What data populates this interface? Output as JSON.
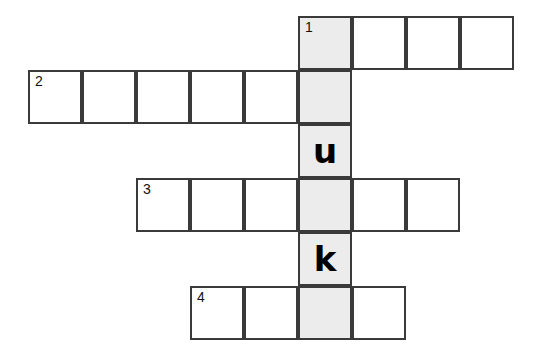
{
  "puzzle": {
    "type": "crossword-grid",
    "cell_size": 54,
    "grid_origin": {
      "x": 28,
      "y": 16
    },
    "colors": {
      "cell_fill": "#ffffff",
      "shaded_fill": "#ececec",
      "border": "#3a3a3a",
      "text": "#000000",
      "page_background": "#ffffff"
    },
    "shaded_column_index": 5,
    "rows": [
      {
        "row_index": 0,
        "start_col": 5,
        "length": 4,
        "cells": [
          {
            "col": 5,
            "clue_number": "1",
            "letter": "",
            "shaded": true
          },
          {
            "col": 6,
            "clue_number": "",
            "letter": "",
            "shaded": false
          },
          {
            "col": 7,
            "clue_number": "",
            "letter": "",
            "shaded": false
          },
          {
            "col": 8,
            "clue_number": "",
            "letter": "",
            "shaded": false
          }
        ]
      },
      {
        "row_index": 1,
        "start_col": 0,
        "length": 6,
        "cells": [
          {
            "col": 0,
            "clue_number": "2",
            "letter": "",
            "shaded": false
          },
          {
            "col": 1,
            "clue_number": "",
            "letter": "",
            "shaded": false
          },
          {
            "col": 2,
            "clue_number": "",
            "letter": "",
            "shaded": false
          },
          {
            "col": 3,
            "clue_number": "",
            "letter": "",
            "shaded": false
          },
          {
            "col": 4,
            "clue_number": "",
            "letter": "",
            "shaded": false
          },
          {
            "col": 5,
            "clue_number": "",
            "letter": "",
            "shaded": true
          }
        ]
      },
      {
        "row_index": 2,
        "start_col": 5,
        "length": 1,
        "cells": [
          {
            "col": 5,
            "clue_number": "",
            "letter": "u",
            "shaded": true
          }
        ]
      },
      {
        "row_index": 3,
        "start_col": 2,
        "length": 6,
        "cells": [
          {
            "col": 2,
            "clue_number": "3",
            "letter": "",
            "shaded": false
          },
          {
            "col": 3,
            "clue_number": "",
            "letter": "",
            "shaded": false
          },
          {
            "col": 4,
            "clue_number": "",
            "letter": "",
            "shaded": false
          },
          {
            "col": 5,
            "clue_number": "",
            "letter": "",
            "shaded": true
          },
          {
            "col": 6,
            "clue_number": "",
            "letter": "",
            "shaded": false
          },
          {
            "col": 7,
            "clue_number": "",
            "letter": "",
            "shaded": false
          }
        ]
      },
      {
        "row_index": 4,
        "start_col": 5,
        "length": 1,
        "cells": [
          {
            "col": 5,
            "clue_number": "",
            "letter": "k",
            "shaded": true
          }
        ]
      },
      {
        "row_index": 5,
        "start_col": 3,
        "length": 4,
        "cells": [
          {
            "col": 3,
            "clue_number": "4",
            "letter": "",
            "shaded": false
          },
          {
            "col": 4,
            "clue_number": "",
            "letter": "",
            "shaded": false
          },
          {
            "col": 5,
            "clue_number": "",
            "letter": "",
            "shaded": true
          },
          {
            "col": 6,
            "clue_number": "",
            "letter": "",
            "shaded": false
          }
        ]
      }
    ]
  }
}
